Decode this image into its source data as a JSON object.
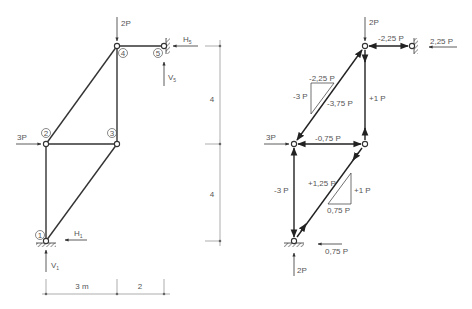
{
  "left_diagram": {
    "title": "Truss geometry and loads",
    "nodes": [
      {
        "id": "1",
        "label": "1"
      },
      {
        "id": "2",
        "label": "2"
      },
      {
        "id": "3",
        "label": "3"
      },
      {
        "id": "4",
        "label": "4"
      },
      {
        "id": "5",
        "label": "5"
      }
    ],
    "loads": {
      "top": "2P",
      "left": "3P"
    },
    "reactions": {
      "H5": "H",
      "H5_sub": "5",
      "V5": "V",
      "V5_sub": "5",
      "H1": "H",
      "H1_sub": "1",
      "V1": "V",
      "V1_sub": "1"
    },
    "dimensions": {
      "vertical_upper": "4",
      "vertical_lower": "4",
      "horizontal_left": "3 m",
      "horizontal_right": "2"
    }
  },
  "right_diagram": {
    "title": "Member forces",
    "loads": {
      "top": "2P",
      "left": "3P"
    },
    "reactions": {
      "top_right": "2,25 P",
      "bottom_horizontal": "0,75 P",
      "bottom_vertical": "2P"
    },
    "member_forces": {
      "m45": "-2,25 P",
      "m34": "+1 P",
      "m24": "-3,75 P",
      "m23": "-0,75 P",
      "m12": "-3 P",
      "m13": "+1,25 P"
    },
    "upper_triangle": {
      "horizontal": "-2,25 P",
      "vertical": "-3 P"
    },
    "lower_triangle": {
      "horizontal": "0,75 P",
      "vertical": "+1 P"
    }
  }
}
